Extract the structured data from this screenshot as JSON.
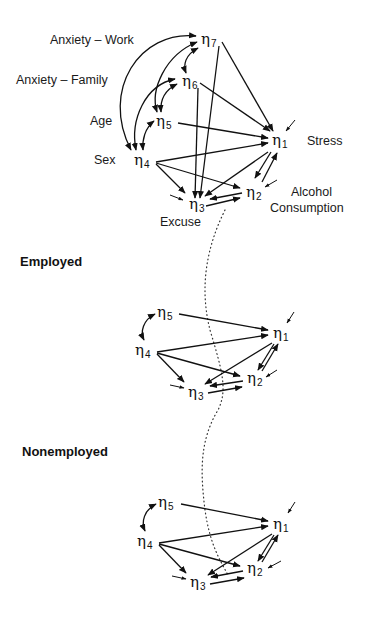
{
  "diagram": {
    "type": "path-model",
    "full_model": {
      "variable_labels": {
        "eta7": "Anxiety – Work",
        "eta6": "Anxiety – Family",
        "eta5": "Age",
        "eta4": "Sex",
        "eta1": "Stress",
        "eta2_line1": "Alcohol",
        "eta2_line2": "Consumption",
        "eta3": "Excuse"
      },
      "nodes": {
        "eta7": {
          "symbol": "η",
          "sub": "7",
          "x": 206,
          "y": 39
        },
        "eta6": {
          "symbol": "η",
          "sub": "6",
          "x": 190,
          "y": 82
        },
        "eta5": {
          "symbol": "η",
          "sub": "5",
          "x": 166,
          "y": 122
        },
        "eta4": {
          "symbol": "η",
          "sub": "4",
          "x": 147,
          "y": 160
        },
        "eta1": {
          "symbol": "η",
          "sub": "1",
          "x": 280,
          "y": 140
        },
        "eta2": {
          "symbol": "η",
          "sub": "2",
          "x": 256,
          "y": 192
        },
        "eta3": {
          "symbol": "η",
          "sub": "3",
          "x": 198,
          "y": 205
        }
      },
      "directed_paths": [
        [
          "eta7",
          "eta1"
        ],
        [
          "eta7",
          "eta3"
        ],
        [
          "eta6",
          "eta1"
        ],
        [
          "eta6",
          "eta3"
        ],
        [
          "eta5",
          "eta1"
        ],
        [
          "eta4",
          "eta1"
        ],
        [
          "eta4",
          "eta2"
        ],
        [
          "eta4",
          "eta3"
        ],
        [
          "eta1",
          "eta2"
        ],
        [
          "eta2",
          "eta1"
        ],
        [
          "eta1",
          "eta3"
        ],
        [
          "eta3",
          "eta2"
        ],
        [
          "eta2",
          "eta3"
        ]
      ],
      "covariances": [
        [
          "eta7",
          "eta6"
        ],
        [
          "eta7",
          "eta5"
        ],
        [
          "eta7",
          "eta4"
        ],
        [
          "eta6",
          "eta5"
        ],
        [
          "eta6",
          "eta4"
        ],
        [
          "eta5",
          "eta4"
        ]
      ],
      "disturbances": [
        "eta1",
        "eta2",
        "eta3"
      ]
    },
    "employed": {
      "title": "Employed",
      "nodes": {
        "eta5": {
          "symbol": "η",
          "sub": "5",
          "x": 165,
          "y": 313
        },
        "eta4": {
          "symbol": "η",
          "sub": "4",
          "x": 143,
          "y": 350
        },
        "eta1": {
          "symbol": "η",
          "sub": "1",
          "x": 281,
          "y": 333
        },
        "eta2": {
          "symbol": "η",
          "sub": "2",
          "x": 255,
          "y": 378
        },
        "eta3": {
          "symbol": "η",
          "sub": "3",
          "x": 196,
          "y": 392
        }
      },
      "directed_paths": [
        [
          "eta5",
          "eta1"
        ],
        [
          "eta4",
          "eta1"
        ],
        [
          "eta4",
          "eta2"
        ],
        [
          "eta4",
          "eta3"
        ],
        [
          "eta1",
          "eta2"
        ],
        [
          "eta2",
          "eta1"
        ],
        [
          "eta1",
          "eta3"
        ],
        [
          "eta3",
          "eta2"
        ],
        [
          "eta2",
          "eta3"
        ]
      ],
      "covariances": [
        [
          "eta5",
          "eta4"
        ]
      ],
      "disturbances": [
        "eta1",
        "eta2",
        "eta3"
      ]
    },
    "nonemployed": {
      "title": "Nonemployed",
      "nodes": {
        "eta5": {
          "symbol": "η",
          "sub": "5",
          "x": 166,
          "y": 503
        },
        "eta4": {
          "symbol": "η",
          "sub": "4",
          "x": 145,
          "y": 541
        },
        "eta1": {
          "symbol": "η",
          "sub": "1",
          "x": 281,
          "y": 524
        },
        "eta2": {
          "symbol": "η",
          "sub": "2",
          "x": 255,
          "y": 568
        },
        "eta3": {
          "symbol": "η",
          "sub": "3",
          "x": 198,
          "y": 582
        }
      },
      "directed_paths": [
        [
          "eta5",
          "eta1"
        ],
        [
          "eta4",
          "eta1"
        ],
        [
          "eta4",
          "eta2"
        ],
        [
          "eta4",
          "eta3"
        ],
        [
          "eta1",
          "eta2"
        ],
        [
          "eta2",
          "eta1"
        ],
        [
          "eta1",
          "eta3"
        ],
        [
          "eta3",
          "eta2"
        ],
        [
          "eta2",
          "eta3"
        ]
      ],
      "covariances": [
        [
          "eta5",
          "eta4"
        ]
      ],
      "disturbances": [
        "eta1",
        "eta2",
        "eta3"
      ]
    }
  }
}
